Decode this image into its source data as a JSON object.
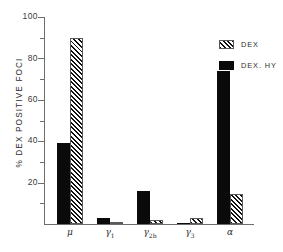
{
  "chart_data": {
    "type": "bar",
    "title": "",
    "xlabel": "",
    "ylabel": "% DEX POSITIVE FOCI",
    "ylim": [
      0,
      100
    ],
    "grid": false,
    "legend_position": "top-right",
    "categories": [
      "μ",
      "γ₁",
      "γ₂ᵦ",
      "γ₃",
      "α"
    ],
    "category_parts": [
      {
        "base": "μ",
        "sub": ""
      },
      {
        "base": "γ",
        "sub": "1"
      },
      {
        "base": "γ",
        "sub": "2b"
      },
      {
        "base": "γ",
        "sub": "3"
      },
      {
        "base": "α",
        "sub": ""
      }
    ],
    "series": [
      {
        "name": "DEX. HY",
        "style": "solid",
        "color": "#0a0a0a",
        "values": [
          39,
          3,
          16,
          0.5,
          74
        ]
      },
      {
        "name": "DEX",
        "style": "hatched",
        "color": "#121212",
        "values": [
          90,
          0.5,
          2,
          3,
          14.5
        ]
      }
    ],
    "y_ticks_major": [
      0,
      20,
      40,
      60,
      80,
      100
    ],
    "y_ticks_minor": [
      10,
      30,
      50,
      70,
      90
    ],
    "y_tick_labels": [
      "0",
      "20",
      "40",
      "60",
      "80",
      "100"
    ]
  },
  "axis": {
    "y_title": "% DEX POSITIVE FOCI",
    "labels": {
      "t100": "100",
      "t80": "80",
      "t60": "60",
      "t40": "40",
      "t20": "20"
    }
  },
  "legend": {
    "items": [
      {
        "label": "DEX",
        "swatch": "hatched-swatch"
      },
      {
        "label": "DEX. HY",
        "swatch": "solid-swatch"
      }
    ]
  },
  "categories_display": {
    "c0_base": "μ",
    "c0_sub": "",
    "c1_base": "γ",
    "c1_sub": "1",
    "c2_base": "γ",
    "c2_sub": "2b",
    "c3_base": "γ",
    "c3_sub": "3",
    "c4_base": "α",
    "c4_sub": ""
  }
}
